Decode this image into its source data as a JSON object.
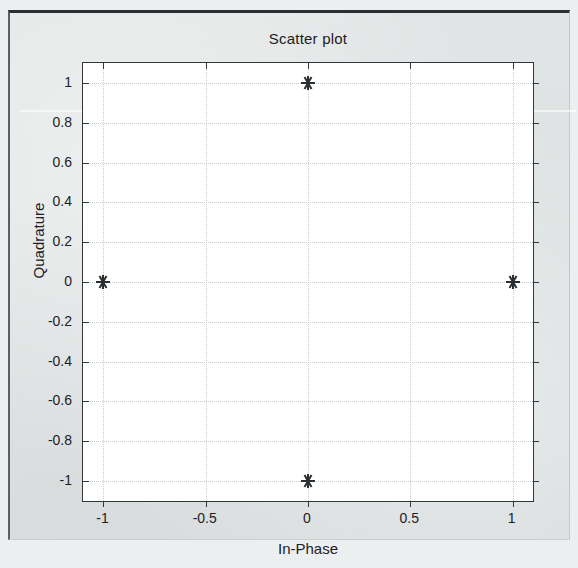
{
  "figure": {
    "background_color": "#d9dddd",
    "plot_background_color": "#ffffff",
    "axis_color": "#31373b",
    "grid_color": "#c8cdd0",
    "marker_color": "#2a2f33"
  },
  "chart_data": {
    "type": "scatter",
    "title": "Scatter plot",
    "xlabel": "In-Phase",
    "ylabel": "Quadrature",
    "xlim": [
      -1.1,
      1.1
    ],
    "ylim": [
      -1.1,
      1.1
    ],
    "grid": true,
    "legend": null,
    "marker": "asterisk",
    "xticks": [
      -1,
      -0.5,
      0,
      0.5,
      1
    ],
    "xtick_labels": [
      "-1",
      "-0.5",
      "0",
      "0.5",
      "1"
    ],
    "yticks": [
      -1,
      -0.8,
      -0.6,
      -0.4,
      -0.2,
      0,
      0.2,
      0.4,
      0.6,
      0.8,
      1
    ],
    "ytick_labels": [
      "-1",
      "-0.8",
      "-0.6",
      "-0.4",
      "-0.2",
      "0",
      "0.2",
      "0.4",
      "0.6",
      "0.8",
      "1"
    ],
    "x": [
      0,
      -1,
      1,
      0
    ],
    "y": [
      1,
      0,
      0,
      -1
    ],
    "points": [
      {
        "x": 0,
        "y": 1
      },
      {
        "x": -1,
        "y": 0
      },
      {
        "x": 1,
        "y": 0
      },
      {
        "x": 0,
        "y": -1
      }
    ]
  }
}
